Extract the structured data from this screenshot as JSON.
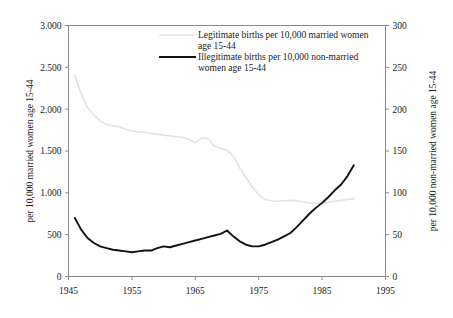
{
  "chart_data": {
    "type": "line",
    "title": "",
    "xlabel": "",
    "ylabel": "per 10,000 married women age 15-44",
    "y2label": "per 10,000 non-married women age 15-44",
    "xlim": [
      1945,
      1995
    ],
    "ylim": [
      0,
      3000
    ],
    "y2lim": [
      0,
      300
    ],
    "grid": false,
    "legend_position": "top-center",
    "xticks": [
      "1945",
      "1955",
      "1965",
      "1975",
      "1985",
      "1995"
    ],
    "xtick_values": [
      1945,
      1955,
      1965,
      1975,
      1985,
      1995
    ],
    "yticks": [
      "0",
      "500",
      "1.000",
      "1.500",
      "2.000",
      "2.500",
      "3.000"
    ],
    "ytick_values": [
      0,
      500,
      1000,
      1500,
      2000,
      2500,
      3000
    ],
    "y2ticks": [
      "0",
      "50",
      "100",
      "150",
      "200",
      "250",
      "300"
    ],
    "y2tick_values": [
      0,
      50,
      100,
      150,
      200,
      250,
      300
    ],
    "series": [
      {
        "name": "Legitimate births per 10,000 married women age 15-44",
        "color": "#e2e2e2",
        "axis": "left",
        "x": [
          1946,
          1947,
          1948,
          1949,
          1950,
          1951,
          1952,
          1953,
          1954,
          1955,
          1956,
          1957,
          1958,
          1959,
          1960,
          1961,
          1962,
          1963,
          1964,
          1965,
          1966,
          1967,
          1968,
          1969,
          1970,
          1971,
          1972,
          1973,
          1974,
          1975,
          1976,
          1977,
          1978,
          1979,
          1980,
          1981,
          1982,
          1983,
          1984,
          1985,
          1986,
          1987,
          1988,
          1989,
          1990
        ],
        "values": [
          2400,
          2180,
          2020,
          1930,
          1860,
          1820,
          1800,
          1790,
          1760,
          1740,
          1730,
          1725,
          1710,
          1700,
          1690,
          1680,
          1670,
          1665,
          1640,
          1600,
          1655,
          1650,
          1560,
          1530,
          1510,
          1440,
          1300,
          1180,
          1070,
          980,
          920,
          905,
          900,
          905,
          910,
          905,
          890,
          880,
          875,
          880,
          890,
          900,
          910,
          920,
          930
        ]
      },
      {
        "name": "Illegitimate births per 10,000 non-married women age 15-44",
        "color": "#111111",
        "axis": "right",
        "x": [
          1946,
          1947,
          1948,
          1949,
          1950,
          1951,
          1952,
          1953,
          1954,
          1955,
          1956,
          1957,
          1958,
          1959,
          1960,
          1961,
          1962,
          1963,
          1964,
          1965,
          1966,
          1967,
          1968,
          1969,
          1970,
          1971,
          1972,
          1973,
          1974,
          1975,
          1976,
          1977,
          1978,
          1979,
          1980,
          1981,
          1982,
          1983,
          1984,
          1985,
          1986,
          1987,
          1988,
          1989,
          1990
        ],
        "values": [
          70,
          56,
          46,
          40,
          36,
          34,
          32,
          31,
          30,
          29,
          30,
          31,
          31,
          34,
          36,
          35,
          37,
          39,
          41,
          43,
          45,
          47,
          49,
          51,
          55,
          48,
          42,
          38,
          36,
          36,
          38,
          41,
          44,
          48,
          52,
          59,
          67,
          75,
          82,
          88,
          95,
          103,
          110,
          120,
          133
        ]
      }
    ],
    "legend": [
      {
        "label_line1": "Legitimate births per 10,000 married women",
        "label_line2": "age 15-44",
        "color": "#e2e2e2"
      },
      {
        "label_line1": "Illegitimate births per 10,000 non-married",
        "label_line2": "women age 15-44",
        "color": "#111111"
      }
    ]
  }
}
